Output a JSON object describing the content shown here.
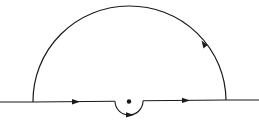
{
  "figure": {
    "type": "contour-integral-diagram",
    "stroke_color": "#1a1a1a",
    "background_color": "#ffffff",
    "real_axis": {
      "x_start": 0,
      "x_end": 259,
      "y": 101
    },
    "large_arc": {
      "cx": 129.5,
      "cy": 101,
      "r": 96.5,
      "orientation": "counterclockwise"
    },
    "indentation": {
      "cx": 129,
      "cy": 101,
      "r": 14,
      "side": "below"
    },
    "singular_point": {
      "cx": 129,
      "cy": 101,
      "r": 2.2
    },
    "arrows": [
      {
        "name": "left-segment-arrow",
        "x": 76,
        "y": 101.7,
        "direction": "right"
      },
      {
        "name": "indentation-arrow",
        "x": 130,
        "y": 115,
        "direction": "right"
      },
      {
        "name": "right-segment-arrow",
        "x": 186,
        "y": 100.4,
        "direction": "right"
      },
      {
        "name": "arc-arrow",
        "x": 204,
        "y": 44,
        "direction": "up-left"
      }
    ],
    "caption": ""
  }
}
